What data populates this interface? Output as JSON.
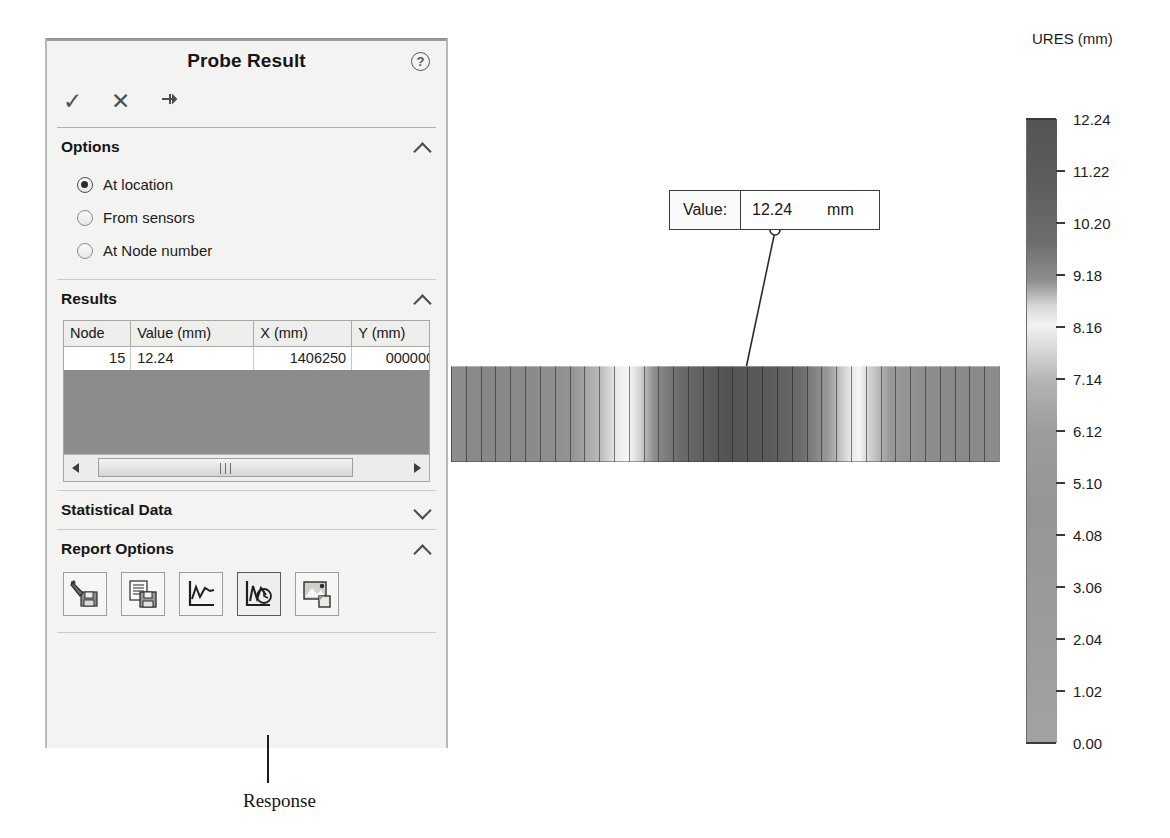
{
  "panel": {
    "title": "Probe Result",
    "help_icon": "help-circle-icon",
    "toolbar": {
      "ok_label": "✓",
      "cancel_label": "✕",
      "pin_label": "⚑"
    },
    "sections": {
      "options": {
        "label": "Options",
        "expanded": true,
        "chevron": "chevron-up-icon",
        "radios": [
          {
            "label": "At location",
            "selected": true
          },
          {
            "label": "From sensors",
            "selected": false
          },
          {
            "label": "At Node number",
            "selected": false
          }
        ]
      },
      "results": {
        "label": "Results",
        "expanded": true,
        "chevron": "chevron-up-icon",
        "columns": [
          "Node",
          "Value (mm)",
          "X (mm)",
          "Y (mm)",
          "Z"
        ],
        "rows": [
          {
            "node": "15",
            "value": "12.24",
            "x": "1406250",
            "y": "0000000",
            "z": "0("
          }
        ],
        "scrollbar": {
          "left_arrow": "scroll-left-icon",
          "right_arrow": "scroll-right-icon",
          "grip": "scroll-grip-icon"
        }
      },
      "statistical_data": {
        "label": "Statistical Data",
        "expanded": false,
        "chevron": "chevron-down-icon"
      },
      "report_options": {
        "label": "Report Options",
        "expanded": true,
        "chevron": "chevron-up-icon",
        "buttons": [
          {
            "name": "save-as-sensor-icon",
            "selected": false
          },
          {
            "name": "save-report-icon",
            "selected": false
          },
          {
            "name": "plot-graph-icon",
            "selected": false
          },
          {
            "name": "response-graph-icon",
            "selected": true
          },
          {
            "name": "save-image-icon",
            "selected": false
          }
        ]
      }
    }
  },
  "callout": {
    "label": "Value:",
    "value": "12.24",
    "unit": "mm"
  },
  "legend": {
    "title": "URES (mm)",
    "ticks": [
      "12.24",
      "11.22",
      "10.20",
      "9.18",
      "8.16",
      "7.14",
      "6.12",
      "5.10",
      "4.08",
      "3.06",
      "2.04",
      "1.02",
      "0.00"
    ]
  },
  "annotation": {
    "text": "Response"
  },
  "chart_data": {
    "type": "heatmap",
    "title": "URES (mm)",
    "ylabel": "URES (mm)",
    "ylim": [
      0.0,
      12.24
    ],
    "tick_values": [
      12.24,
      11.22,
      10.2,
      9.18,
      8.16,
      7.14,
      6.12,
      5.1,
      4.08,
      3.06,
      2.04,
      1.02,
      0.0
    ],
    "tick_step": 1.02,
    "colormap": "grayscale",
    "probed_point": {
      "node": 15,
      "value": 12.24,
      "unit": "mm",
      "x": 1406250,
      "y": 0,
      "z": 0
    }
  }
}
